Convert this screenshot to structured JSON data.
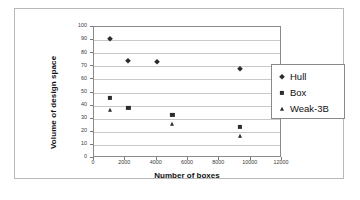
{
  "chart_data": {
    "type": "scatter",
    "title": "",
    "xlabel": "Number of boxes",
    "ylabel": "Volume of design space",
    "xlim": [
      0,
      12000
    ],
    "ylim": [
      0,
      100
    ],
    "xticks": [
      "0",
      "2000",
      "4000",
      "6000",
      "8000",
      "10000",
      "12000"
    ],
    "xtick_values": [
      0,
      2000,
      4000,
      6000,
      8000,
      10000,
      12000
    ],
    "yticks": [
      "0",
      "10",
      "20",
      "30",
      "40",
      "50",
      "60",
      "70",
      "80",
      "90",
      "100"
    ],
    "ytick_values": [
      0,
      10,
      20,
      30,
      40,
      50,
      60,
      70,
      80,
      90,
      100
    ],
    "grid": "horizontal",
    "legend_position": "right",
    "series": [
      {
        "name": "Hull",
        "marker": "diamond",
        "color": "#2b2b2b",
        "points": [
          {
            "x": 1000,
            "y": 91
          },
          {
            "x": 2200,
            "y": 74
          },
          {
            "x": 4000,
            "y": 73
          },
          {
            "x": 9300,
            "y": 68
          }
        ]
      },
      {
        "name": "Box",
        "marker": "square",
        "color": "#2b2b2b",
        "points": [
          {
            "x": 1000,
            "y": 46
          },
          {
            "x": 2200,
            "y": 38
          },
          {
            "x": 5000,
            "y": 33
          },
          {
            "x": 9300,
            "y": 24
          }
        ]
      },
      {
        "name": "Weak-3B",
        "marker": "triangle",
        "color": "#2b2b2b",
        "points": [
          {
            "x": 1000,
            "y": 37
          },
          {
            "x": 5000,
            "y": 26
          },
          {
            "x": 9300,
            "y": 17
          }
        ]
      }
    ]
  }
}
